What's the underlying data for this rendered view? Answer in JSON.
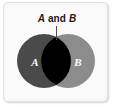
{
  "figure": {
    "name": "venn-diagram-intersection",
    "title": "A and B",
    "panel_bg": "#f7f7f7",
    "panel_border": "#e2e2e2"
  },
  "caption": {
    "set_a": "A",
    "conjunction": " and ",
    "set_b": "B",
    "full_text": "A and B",
    "color": "#1a1a1a"
  },
  "leader_line": {
    "color": "#4d4d4d"
  },
  "diagram": {
    "type": "venn",
    "sets": [
      {
        "id": "set-a",
        "label": "A",
        "fill": "#4a4a4a",
        "label_color": "#ffffff",
        "cx": 44,
        "cy": 61,
        "r": 27
      },
      {
        "id": "set-b",
        "label": "B",
        "fill": "#8c8c8c",
        "label_color": "#ffffff",
        "cx": 68,
        "cy": 61,
        "r": 27
      }
    ],
    "intersection": {
      "id": "intersection-ab",
      "label": "A and B",
      "fill": "#000000",
      "highlighted": true
    }
  }
}
